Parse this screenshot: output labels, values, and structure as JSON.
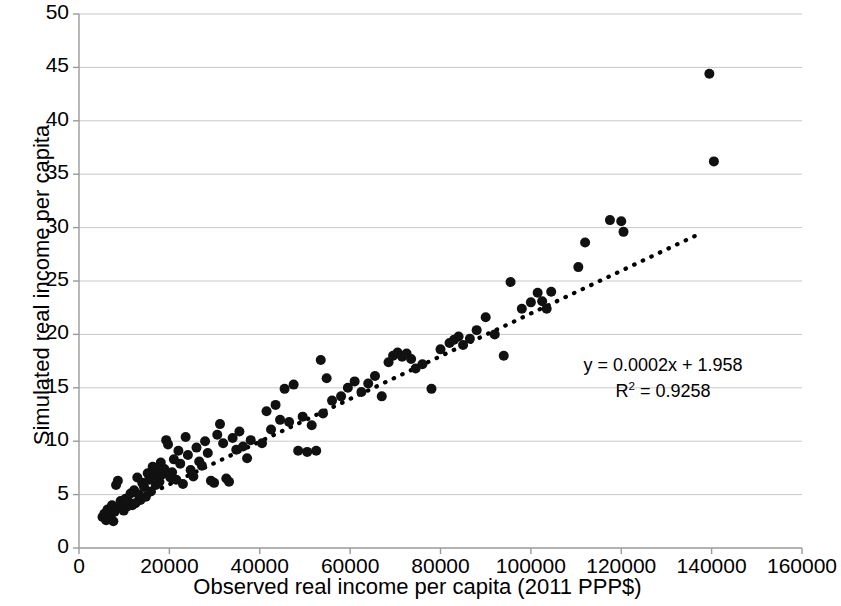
{
  "chart_data": {
    "type": "scatter",
    "title": "",
    "xlabel": "Observed real income per capita (2011 PPP$)",
    "ylabel": "Simulated real income per capita",
    "xlim": [
      0,
      160000
    ],
    "ylim": [
      0,
      50
    ],
    "xticks": [
      "0",
      "20000",
      "40000",
      "60000",
      "80000",
      "100000",
      "120000",
      "140000",
      "160000"
    ],
    "xtick_values": [
      0,
      20000,
      40000,
      60000,
      80000,
      100000,
      120000,
      140000,
      160000
    ],
    "yticks": [
      "0",
      "5",
      "10",
      "15",
      "20",
      "25",
      "30",
      "35",
      "40",
      "45",
      "50"
    ],
    "ytick_values": [
      0,
      5,
      10,
      15,
      20,
      25,
      30,
      35,
      40,
      45,
      50
    ],
    "grid": "horizontal",
    "legend": "none",
    "marker_color": "#111111",
    "marker_size": 10,
    "gridline_color": "#c8c8c8",
    "axis_color": "#9a9a9a",
    "trendline": {
      "style": "dotted",
      "color": "#000000",
      "equation": "y = 0.0002x + 1.958",
      "r2_label": "R² = 0.9258",
      "r2_base": "R",
      "r2_exp": "2",
      "r2_rest": " = 0.9258",
      "slope": 0.0002,
      "intercept": 1.958,
      "r_squared": 0.9258,
      "x_start": 5000,
      "x_end": 138000
    },
    "annotations": [
      "y = 0.0002x + 1.958",
      "R² = 0.9258"
    ],
    "points": [
      [
        5200,
        2.9
      ],
      [
        5600,
        3.2
      ],
      [
        6000,
        2.6
      ],
      [
        6300,
        3.6
      ],
      [
        6600,
        2.8
      ],
      [
        7000,
        3.1
      ],
      [
        7300,
        4.0
      ],
      [
        7600,
        2.5
      ],
      [
        7900,
        3.4
      ],
      [
        8200,
        5.9
      ],
      [
        8600,
        6.3
      ],
      [
        8900,
        3.8
      ],
      [
        9200,
        4.4
      ],
      [
        9600,
        4.1
      ],
      [
        9900,
        3.5
      ],
      [
        10300,
        4.6
      ],
      [
        10700,
        3.9
      ],
      [
        11000,
        4.3
      ],
      [
        11400,
        5.1
      ],
      [
        11800,
        4.0
      ],
      [
        12200,
        5.4
      ],
      [
        12500,
        4.2
      ],
      [
        12900,
        6.6
      ],
      [
        13200,
        5.0
      ],
      [
        13600,
        4.5
      ],
      [
        14000,
        6.1
      ],
      [
        14400,
        5.7
      ],
      [
        14800,
        4.8
      ],
      [
        15200,
        7.0
      ],
      [
        15500,
        6.4
      ],
      [
        15900,
        5.3
      ],
      [
        16300,
        7.6
      ],
      [
        16700,
        6.8
      ],
      [
        17000,
        5.9
      ],
      [
        17400,
        7.2
      ],
      [
        17800,
        6.2
      ],
      [
        18100,
        8.0
      ],
      [
        18500,
        6.9
      ],
      [
        18900,
        7.4
      ],
      [
        19300,
        10.1
      ],
      [
        19700,
        9.7
      ],
      [
        20200,
        6.6
      ],
      [
        20600,
        7.1
      ],
      [
        21000,
        8.3
      ],
      [
        21500,
        6.4
      ],
      [
        22000,
        9.1
      ],
      [
        22400,
        7.9
      ],
      [
        23000,
        6.0
      ],
      [
        23600,
        10.4
      ],
      [
        24100,
        8.7
      ],
      [
        24700,
        7.3
      ],
      [
        25300,
        6.7
      ],
      [
        26000,
        9.4
      ],
      [
        26600,
        8.1
      ],
      [
        27200,
        7.7
      ],
      [
        27900,
        10.0
      ],
      [
        28500,
        8.9
      ],
      [
        29200,
        6.3
      ],
      [
        29900,
        6.1
      ],
      [
        30600,
        10.6
      ],
      [
        31200,
        11.6
      ],
      [
        31900,
        9.8
      ],
      [
        32600,
        6.5
      ],
      [
        33200,
        6.2
      ],
      [
        34000,
        10.3
      ],
      [
        34800,
        9.2
      ],
      [
        35500,
        10.9
      ],
      [
        36300,
        9.5
      ],
      [
        37200,
        8.4
      ],
      [
        38000,
        10.1
      ],
      [
        40500,
        9.8
      ],
      [
        41500,
        12.8
      ],
      [
        42500,
        11.1
      ],
      [
        43500,
        13.4
      ],
      [
        44500,
        12.0
      ],
      [
        45500,
        14.9
      ],
      [
        46500,
        11.8
      ],
      [
        47500,
        15.3
      ],
      [
        48500,
        9.1
      ],
      [
        49500,
        12.3
      ],
      [
        50500,
        9.0
      ],
      [
        51500,
        11.5
      ],
      [
        52500,
        9.1
      ],
      [
        53500,
        17.6
      ],
      [
        54000,
        12.6
      ],
      [
        54800,
        15.9
      ],
      [
        56000,
        13.8
      ],
      [
        58000,
        14.2
      ],
      [
        59500,
        15.0
      ],
      [
        61000,
        15.6
      ],
      [
        62500,
        14.6
      ],
      [
        64000,
        15.4
      ],
      [
        65500,
        16.1
      ],
      [
        67000,
        14.2
      ],
      [
        68500,
        17.4
      ],
      [
        69500,
        18.0
      ],
      [
        70500,
        18.3
      ],
      [
        71500,
        17.9
      ],
      [
        72500,
        18.2
      ],
      [
        73500,
        17.7
      ],
      [
        74500,
        16.8
      ],
      [
        76000,
        17.2
      ],
      [
        78000,
        14.9
      ],
      [
        80000,
        18.6
      ],
      [
        82000,
        19.2
      ],
      [
        83000,
        19.5
      ],
      [
        84000,
        19.8
      ],
      [
        85000,
        19.0
      ],
      [
        86500,
        19.6
      ],
      [
        88000,
        20.4
      ],
      [
        90000,
        21.6
      ],
      [
        92000,
        20.0
      ],
      [
        94000,
        18.0
      ],
      [
        95500,
        24.9
      ],
      [
        98000,
        22.4
      ],
      [
        100000,
        23.0
      ],
      [
        101500,
        23.9
      ],
      [
        102500,
        23.1
      ],
      [
        103500,
        22.4
      ],
      [
        104500,
        24.0
      ],
      [
        110500,
        26.3
      ],
      [
        112000,
        28.6
      ],
      [
        117500,
        30.7
      ],
      [
        120000,
        30.6
      ],
      [
        120500,
        29.6
      ],
      [
        139500,
        44.4
      ],
      [
        140500,
        36.2
      ]
    ]
  },
  "axes": {
    "x_title": "Observed real income per capita (2011 PPP$)",
    "y_title": "Simulated real income per capita"
  },
  "annotation": {
    "equation": "y = 0.0002x + 1.958",
    "r2_prefix": "R",
    "r2_sup": "2",
    "r2_value": " = 0.9258"
  }
}
